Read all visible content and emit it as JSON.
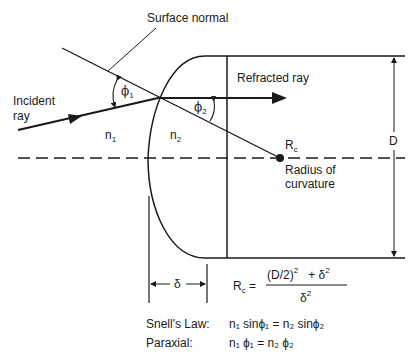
{
  "labels": {
    "surface_normal": "Surface normal",
    "refracted_ray": "Refracted ray",
    "incident_ray_line1": "Incident",
    "incident_ray_line2": "ray",
    "n1": "n",
    "n1_sub": "1",
    "n2": "n",
    "n2_sub": "2",
    "phi1": "ϕ",
    "phi1_sub": "1",
    "phi2": "ϕ",
    "phi2_sub": "2",
    "rc": "R",
    "rc_sub": "c",
    "radius_line1": "Radius of",
    "radius_line2": "curvature",
    "D": "D",
    "delta": "δ"
  },
  "formulas": {
    "rc_formula": {
      "lhs": "R",
      "lhs_sub": "c",
      "equals": "=",
      "numerator": "(D/2)² + δ²",
      "numerator_base": "(D/2)",
      "numerator_exp": "2",
      "numerator_plus": "+ δ",
      "numerator_plus_exp": "2",
      "denominator": "δ",
      "denominator_exp": "2"
    },
    "snells_law": {
      "label": "Snell's Law:",
      "expression": "n₁ sinϕ₁ = n₂ sinϕ₂"
    },
    "paraxial": {
      "label": "Paraxial:",
      "expression": "n₁ ϕ₁ = n₂ ϕ₂"
    }
  },
  "colors": {
    "line": "#1a1a1a",
    "background": "#ffffff"
  }
}
